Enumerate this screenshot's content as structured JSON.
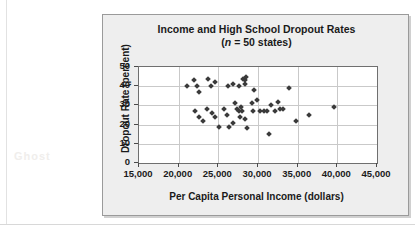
{
  "figure": {
    "ghost_text": "Ghost",
    "title": "Income and High School Dropout Rates",
    "subtitle_prefix": "(",
    "subtitle_italic": "n",
    "subtitle_suffix": " = 50 states)"
  },
  "chart_data": {
    "type": "scatter",
    "title": "Income and High School Dropout Rates",
    "subtitle": "(n = 50 states)",
    "xlabel": "Per Capita Personal Income (dollars)",
    "ylabel": "Dropout Rate (percent)",
    "xlim": [
      15000,
      45000
    ],
    "ylim": [
      0,
      50
    ],
    "xticks": [
      15000,
      20000,
      25000,
      30000,
      35000,
      40000,
      45000
    ],
    "xtick_labels": [
      "15,000",
      "20,000",
      "25,000",
      "30,000",
      "35,000",
      "40,000",
      "45,000"
    ],
    "yticks": [
      0,
      10,
      20,
      30,
      40,
      50
    ],
    "ytick_labels": [
      "0",
      "10",
      "20",
      "30",
      "40",
      "50"
    ],
    "grid": true,
    "legend": null,
    "marker": "diamond",
    "marker_color": "#3a3a3a",
    "n_points": 50,
    "points": [
      {
        "x": 21000,
        "y": 40
      },
      {
        "x": 21900,
        "y": 43
      },
      {
        "x": 22300,
        "y": 40
      },
      {
        "x": 22600,
        "y": 37
      },
      {
        "x": 23700,
        "y": 44
      },
      {
        "x": 24100,
        "y": 40
      },
      {
        "x": 24600,
        "y": 42
      },
      {
        "x": 26200,
        "y": 40
      },
      {
        "x": 26900,
        "y": 41
      },
      {
        "x": 27600,
        "y": 40
      },
      {
        "x": 28100,
        "y": 44
      },
      {
        "x": 28300,
        "y": 43
      },
      {
        "x": 28400,
        "y": 41
      },
      {
        "x": 28500,
        "y": 45
      },
      {
        "x": 29500,
        "y": 38
      },
      {
        "x": 33900,
        "y": 39
      },
      {
        "x": 22100,
        "y": 27
      },
      {
        "x": 22500,
        "y": 24
      },
      {
        "x": 23100,
        "y": 22
      },
      {
        "x": 23600,
        "y": 28
      },
      {
        "x": 24200,
        "y": 26
      },
      {
        "x": 24600,
        "y": 24
      },
      {
        "x": 25100,
        "y": 19
      },
      {
        "x": 25700,
        "y": 28
      },
      {
        "x": 26100,
        "y": 25
      },
      {
        "x": 26300,
        "y": 19
      },
      {
        "x": 26800,
        "y": 21
      },
      {
        "x": 27100,
        "y": 31
      },
      {
        "x": 27400,
        "y": 28
      },
      {
        "x": 27600,
        "y": 27
      },
      {
        "x": 27700,
        "y": 24
      },
      {
        "x": 27900,
        "y": 29
      },
      {
        "x": 28000,
        "y": 27
      },
      {
        "x": 28300,
        "y": 23
      },
      {
        "x": 28600,
        "y": 18
      },
      {
        "x": 29200,
        "y": 31
      },
      {
        "x": 29400,
        "y": 27
      },
      {
        "x": 29900,
        "y": 33
      },
      {
        "x": 30300,
        "y": 27
      },
      {
        "x": 30800,
        "y": 27
      },
      {
        "x": 31100,
        "y": 27
      },
      {
        "x": 31400,
        "y": 15
      },
      {
        "x": 31700,
        "y": 30
      },
      {
        "x": 32200,
        "y": 27
      },
      {
        "x": 32500,
        "y": 32
      },
      {
        "x": 32800,
        "y": 28
      },
      {
        "x": 33100,
        "y": 28
      },
      {
        "x": 34800,
        "y": 22
      },
      {
        "x": 36400,
        "y": 25
      },
      {
        "x": 39600,
        "y": 29
      }
    ]
  }
}
